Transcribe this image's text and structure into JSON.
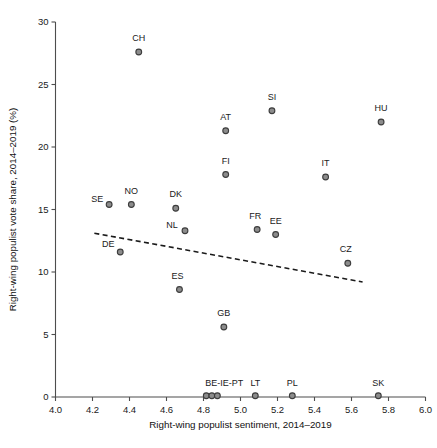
{
  "chart_data": {
    "type": "scatter",
    "title": "",
    "xlabel": "Right-wing populist sentiment, 2014–2019",
    "ylabel": "Right-wing populist vote share, 2014–2019 (%)",
    "xlim": [
      4.0,
      6.0
    ],
    "ylim": [
      0,
      30
    ],
    "xticks": [
      4.0,
      4.2,
      4.4,
      4.6,
      4.8,
      5.0,
      5.2,
      5.4,
      5.6,
      5.8,
      6.0
    ],
    "xticklabels": [
      "4.0",
      "4.2",
      "4.4",
      "4.6",
      "4.8",
      "5.0",
      "5.2",
      "5.4",
      "5.6",
      "5.8",
      "6.0"
    ],
    "yticks": [
      0,
      5,
      10,
      15,
      20,
      25,
      30
    ],
    "yticklabels": [
      "0",
      "5",
      "10",
      "15",
      "20",
      "25",
      "30"
    ],
    "grid": false,
    "legend": false,
    "marker_color": "#8c8c8c",
    "marker_edge_color": "#3d3d3d",
    "trendline_color": "#1a1a1a",
    "points": [
      {
        "label": "CH",
        "x": 4.45,
        "y": 27.6,
        "label_dx": 0,
        "label_dy": -11
      },
      {
        "label": "SI",
        "x": 5.17,
        "y": 22.9,
        "label_dx": 0,
        "label_dy": -11
      },
      {
        "label": "HU",
        "x": 5.76,
        "y": 22.0,
        "label_dx": 0,
        "label_dy": -11
      },
      {
        "label": "AT",
        "x": 4.92,
        "y": 21.3,
        "label_dx": 0,
        "label_dy": -11
      },
      {
        "label": "FI",
        "x": 4.92,
        "y": 17.8,
        "label_dx": 0,
        "label_dy": -11
      },
      {
        "label": "IT",
        "x": 5.46,
        "y": 17.6,
        "label_dx": 0,
        "label_dy": -11
      },
      {
        "label": "SE",
        "x": 4.29,
        "y": 15.4,
        "label_dx": -12,
        "label_dy": -3
      },
      {
        "label": "NO",
        "x": 4.41,
        "y": 15.4,
        "label_dx": 0,
        "label_dy": -11
      },
      {
        "label": "DK",
        "x": 4.65,
        "y": 15.1,
        "label_dx": 0,
        "label_dy": -11
      },
      {
        "label": "NL",
        "x": 4.7,
        "y": 13.3,
        "label_dx": -13,
        "label_dy": -3
      },
      {
        "label": "FR",
        "x": 5.09,
        "y": 13.4,
        "label_dx": -2,
        "label_dy": -11
      },
      {
        "label": "EE",
        "x": 5.19,
        "y": 13.0,
        "label_dx": 0,
        "label_dy": -11
      },
      {
        "label": "DE",
        "x": 4.35,
        "y": 11.6,
        "label_dx": -12,
        "label_dy": -5
      },
      {
        "label": "CZ",
        "x": 5.58,
        "y": 10.7,
        "label_dx": -2,
        "label_dy": -11
      },
      {
        "label": "ES",
        "x": 4.67,
        "y": 8.6,
        "label_dx": -2,
        "label_dy": -11
      },
      {
        "label": "GB",
        "x": 4.91,
        "y": 5.6,
        "label_dx": 0,
        "label_dy": -11
      },
      {
        "label": "BE-IE-PT",
        "x": 4.815,
        "y": 0.1,
        "label_dx": 18,
        "label_dy": -10
      },
      {
        "label": "",
        "x": 4.845,
        "y": 0.1,
        "label_dx": 0,
        "label_dy": 0
      },
      {
        "label": "",
        "x": 4.875,
        "y": 0.1,
        "label_dx": 0,
        "label_dy": 0
      },
      {
        "label": "LT",
        "x": 5.08,
        "y": 0.1,
        "label_dx": 0,
        "label_dy": -10
      },
      {
        "label": "PL",
        "x": 5.28,
        "y": 0.1,
        "label_dx": 0,
        "label_dy": -10
      },
      {
        "label": "SK",
        "x": 5.745,
        "y": 0.1,
        "label_dx": 0,
        "label_dy": -10
      }
    ],
    "trendline": {
      "x1": 4.21,
      "y1": 13.1,
      "x2": 5.66,
      "y2": 9.2
    }
  }
}
